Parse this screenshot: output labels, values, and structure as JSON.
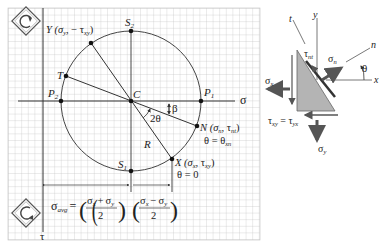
{
  "mohr_circle": {
    "center_label": "C",
    "points": {
      "S2": {
        "label": "S",
        "sub": "2"
      },
      "S1": {
        "label": "S",
        "sub": "1"
      },
      "P1": {
        "label": "P",
        "sub": "1"
      },
      "P2": {
        "label": "P",
        "sub": "2"
      },
      "T": {
        "label": "T"
      },
      "Y": {
        "label": "Y (σ",
        "rest": ", − τ",
        "sub1": "y",
        "sub2": "xy",
        "close": ")"
      },
      "X": {
        "label": "X (σ",
        "rest": ", τ",
        "sub1": "x",
        "sub2": "xy",
        "close": ")",
        "note": "θ = 0"
      },
      "N": {
        "label": "N (σ",
        "rest": ", τ",
        "sub1": "n",
        "sub2": "nt",
        "close": ")",
        "note_a": "θ = θ",
        "note_sub": "xn"
      }
    },
    "axis_sigma": "σ",
    "axis_tau": "τ",
    "angle_2theta": "2θ",
    "angle_beta": "β",
    "radius_label": "R",
    "avg_label": "σ",
    "avg_sub": "avg",
    "avg_eq": "=",
    "frac1_num_a": "σ",
    "frac1_num_a_sub": "x",
    "frac1_plus": "+",
    "frac1_num_b": "σ",
    "frac1_num_b_sub": "y",
    "frac_den": "2",
    "frac2_minus": "−"
  },
  "element": {
    "axis_x": "x",
    "axis_y": "y",
    "axis_n": "n",
    "axis_t": "t",
    "theta": "θ",
    "sigma_x": "σ",
    "sigma_x_sub": "x",
    "sigma_y": "σ",
    "sigma_y_sub": "y",
    "sigma_n": "σ",
    "sigma_n_sub": "n",
    "tau_nt": "τ",
    "tau_nt_sub": "nt",
    "tau_eq": "τ",
    "tau_eq_sub1": "xy",
    "tau_eq_mid": " = τ",
    "tau_eq_sub2": "yx"
  },
  "icons": [
    "rotate-icon-top",
    "rotate-icon-bottom"
  ]
}
